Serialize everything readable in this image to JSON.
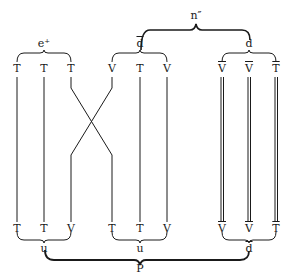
{
  "diagram": {
    "top_labels": {
      "group_left": "e⁺",
      "group_mid": "d",
      "group_mid_bar": true,
      "group_right": "d",
      "super_brace": "n″"
    },
    "columns": [
      {
        "top": "T",
        "bottom": "T",
        "bar": false
      },
      {
        "top": "T",
        "bottom": "T",
        "bar": false
      },
      {
        "top": "T",
        "bottom": "V",
        "bar": false
      },
      {
        "top": "V",
        "bottom": "T",
        "bar": false
      },
      {
        "top": "T",
        "bottom": "T",
        "bar": false
      },
      {
        "top": "V",
        "bottom": "V",
        "bar": false
      },
      {
        "top": "V",
        "bottom": "V",
        "bar": true
      },
      {
        "top": "V",
        "bottom": "V",
        "bar": true
      },
      {
        "top": "T",
        "bottom": "T",
        "bar": true
      }
    ],
    "bottom_labels": {
      "group_left": "u",
      "group_mid": "u",
      "group_right": "d",
      "group_right_bar": true,
      "super_brace": "P"
    }
  }
}
